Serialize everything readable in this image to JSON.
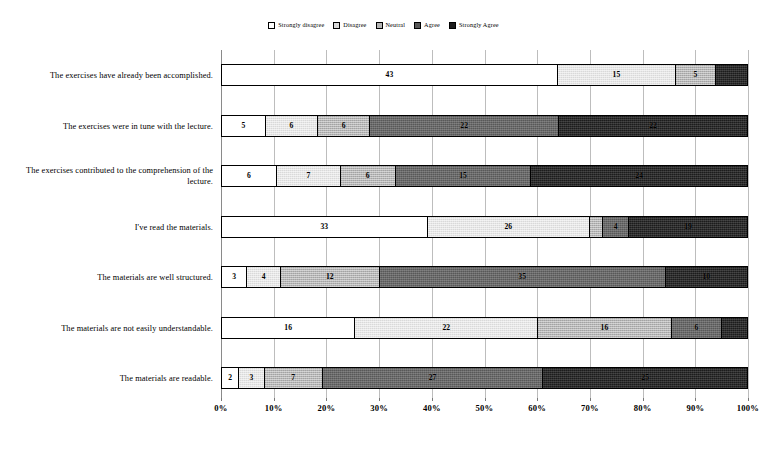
{
  "chart_data": {
    "type": "bar",
    "subtype": "horizontal-stacked-percent",
    "title": "",
    "xlabel": "",
    "ylabel": "",
    "xlim": [
      0,
      100
    ],
    "grid": true,
    "legend_position": "top-center",
    "xticks": [
      "0%",
      "10%",
      "20%",
      "30%",
      "40%",
      "50%",
      "60%",
      "70%",
      "80%",
      "90%",
      "100%"
    ],
    "legend": [
      "Strongly disagree",
      "Disagree",
      "Neutral",
      "Agree",
      "Strongly Agree"
    ],
    "colors": [
      "#ffffff",
      "#d9d9d9",
      "#b5b5b5",
      "#585858",
      "#1c1c1c"
    ],
    "categories": [
      "The exercises have already been accomplished.",
      "The exercises were in tune with the lecture.",
      "The exercises contributed to the comprehension of the lecture.",
      "I've read the materials.",
      "The materials are well structured.",
      "The materials are not easily understandable.",
      "The materials are readable."
    ],
    "series": [
      {
        "name": "Strongly disagree",
        "values": [
          43,
          5,
          6,
          33,
          3,
          16,
          2
        ]
      },
      {
        "name": "Disagree",
        "values": [
          15,
          6,
          7,
          26,
          4,
          22,
          3
        ]
      },
      {
        "name": "Neutral",
        "values": [
          5,
          6,
          6,
          2,
          12,
          16,
          7
        ]
      },
      {
        "name": "Agree",
        "values": [
          0,
          22,
          15,
          4,
          35,
          6,
          27
        ]
      },
      {
        "name": "Strongly Agree",
        "values": [
          4,
          22,
          24,
          19,
          10,
          3,
          25
        ]
      }
    ],
    "rows": [
      {
        "label": "The exercises have already been accomplished.",
        "segments": [
          {
            "category": "Strongly disagree",
            "value": 43,
            "show_value": true
          },
          {
            "category": "Disagree",
            "value": 15,
            "show_value": true
          },
          {
            "category": "Neutral",
            "value": 5,
            "show_value": true
          },
          {
            "category": "Agree",
            "value": 0,
            "show_value": false
          },
          {
            "category": "Strongly Agree",
            "value": 4,
            "show_value": false
          }
        ]
      },
      {
        "label": "The exercises were in tune with the lecture.",
        "segments": [
          {
            "category": "Strongly disagree",
            "value": 5,
            "show_value": true
          },
          {
            "category": "Disagree",
            "value": 6,
            "show_value": true
          },
          {
            "category": "Neutral",
            "value": 6,
            "show_value": true
          },
          {
            "category": "Agree",
            "value": 22,
            "show_value": true
          },
          {
            "category": "Strongly Agree",
            "value": 22,
            "show_value": true
          }
        ]
      },
      {
        "label": "The exercises contributed to the comprehension of the lecture.",
        "segments": [
          {
            "category": "Strongly disagree",
            "value": 6,
            "show_value": true
          },
          {
            "category": "Disagree",
            "value": 7,
            "show_value": true
          },
          {
            "category": "Neutral",
            "value": 6,
            "show_value": true
          },
          {
            "category": "Agree",
            "value": 15,
            "show_value": true
          },
          {
            "category": "Strongly Agree",
            "value": 24,
            "show_value": true
          }
        ]
      },
      {
        "label": "I've read the materials.",
        "segments": [
          {
            "category": "Strongly disagree",
            "value": 33,
            "show_value": true
          },
          {
            "category": "Disagree",
            "value": 26,
            "show_value": true
          },
          {
            "category": "Neutral",
            "value": 2,
            "show_value": false
          },
          {
            "category": "Agree",
            "value": 4,
            "show_value": true
          },
          {
            "category": "Strongly Agree",
            "value": 19,
            "show_value": true
          }
        ]
      },
      {
        "label": "The materials are well structured.",
        "segments": [
          {
            "category": "Strongly disagree",
            "value": 3,
            "show_value": true
          },
          {
            "category": "Disagree",
            "value": 4,
            "show_value": true
          },
          {
            "category": "Neutral",
            "value": 12,
            "show_value": true
          },
          {
            "category": "Agree",
            "value": 35,
            "show_value": true
          },
          {
            "category": "Strongly Agree",
            "value": 10,
            "show_value": true
          }
        ]
      },
      {
        "label": "The materials are not easily understandable.",
        "segments": [
          {
            "category": "Strongly disagree",
            "value": 16,
            "show_value": true
          },
          {
            "category": "Disagree",
            "value": 22,
            "show_value": true
          },
          {
            "category": "Neutral",
            "value": 16,
            "show_value": true
          },
          {
            "category": "Agree",
            "value": 6,
            "show_value": true
          },
          {
            "category": "Strongly Agree",
            "value": 3,
            "show_value": false
          }
        ]
      },
      {
        "label": "The materials are readable.",
        "segments": [
          {
            "category": "Strongly disagree",
            "value": 2,
            "show_value": true
          },
          {
            "category": "Disagree",
            "value": 3,
            "show_value": true
          },
          {
            "category": "Neutral",
            "value": 7,
            "show_value": true
          },
          {
            "category": "Agree",
            "value": 27,
            "show_value": true
          },
          {
            "category": "Strongly Agree",
            "value": 25,
            "show_value": true
          }
        ]
      }
    ]
  }
}
